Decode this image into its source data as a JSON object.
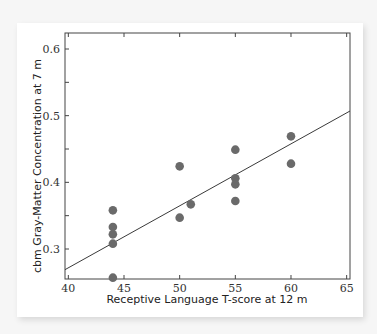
{
  "chart_data": {
    "type": "scatter",
    "title": "",
    "xlabel": "Receptive Language T-score at 12 m",
    "ylabel": "cbm Gray-Matter Concentration at 7 m",
    "xlim": [
      39.7,
      65.3
    ],
    "ylim": [
      0.255,
      0.624
    ],
    "x_ticks": [
      40,
      45,
      50,
      55,
      60,
      65
    ],
    "x_tick_labels": [
      "40",
      "45",
      "50",
      "55",
      "60",
      "65"
    ],
    "y_ticks": [
      0.3,
      0.35,
      0.4,
      0.45,
      0.5,
      0.55,
      0.6
    ],
    "y_tick_labels": [
      "0.3",
      "",
      "0.4",
      "",
      "0.5",
      "",
      "0.6"
    ],
    "grid": false,
    "legend": null,
    "series": [
      {
        "name": "subjects",
        "points": [
          {
            "x": 44,
            "y": 0.358
          },
          {
            "x": 44,
            "y": 0.333
          },
          {
            "x": 44,
            "y": 0.322
          },
          {
            "x": 44,
            "y": 0.308
          },
          {
            "x": 44,
            "y": 0.257
          },
          {
            "x": 50,
            "y": 0.424
          },
          {
            "x": 50,
            "y": 0.347
          },
          {
            "x": 51,
            "y": 0.367
          },
          {
            "x": 55,
            "y": 0.449
          },
          {
            "x": 55,
            "y": 0.406
          },
          {
            "x": 55,
            "y": 0.397
          },
          {
            "x": 55,
            "y": 0.372
          },
          {
            "x": 60,
            "y": 0.469
          },
          {
            "x": 60,
            "y": 0.428
          }
        ]
      }
    ],
    "regression_line": {
      "x1": 39.7,
      "y1": 0.269,
      "x2": 65.3,
      "y2": 0.507
    },
    "colors": {
      "point": "#6a6a6a",
      "line": "#3a3a3a",
      "axis": "#444444"
    }
  }
}
